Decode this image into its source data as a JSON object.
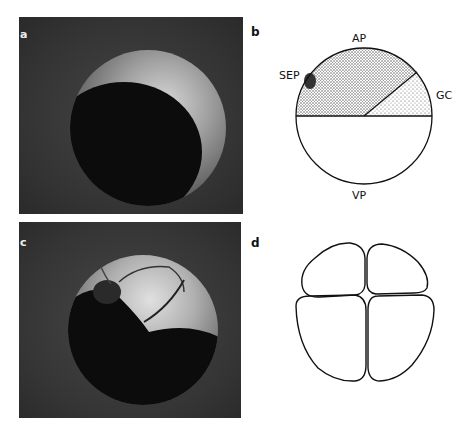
{
  "figure": {
    "panels": [
      {
        "id": "a",
        "label": "a",
        "type": "photograph",
        "description": "Egg, animal pole lighter crescent, dark vegetal region"
      },
      {
        "id": "b",
        "label": "b",
        "type": "diagram",
        "regions": [
          "AP",
          "SEP",
          "GC",
          "VP"
        ]
      },
      {
        "id": "c",
        "label": "c",
        "type": "photograph",
        "description": "4-cell stage embryo showing cleavage furrows"
      },
      {
        "id": "d",
        "label": "d",
        "type": "diagram",
        "description": "Outline of four blastomeres"
      }
    ],
    "diagram_b_labels": {
      "top": "AP",
      "left": "SEP",
      "right": "GC",
      "bottom": "VP"
    }
  }
}
